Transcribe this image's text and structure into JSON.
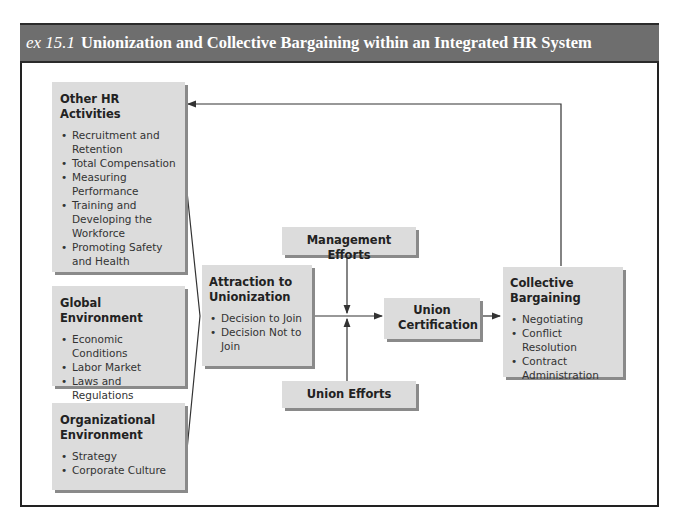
{
  "header": {
    "exhibit_label": "ex 15.1",
    "title": "Unionization and Collective Bargaining within an Integrated HR System"
  },
  "boxes": {
    "other_hr": {
      "title": "Other HR Activities",
      "items": [
        "Recruitment and Retention",
        "Total Compensation",
        "Measuring Performance",
        "Training and Developing the Workforce",
        "Promoting Safety and Health"
      ]
    },
    "global": {
      "title": "Global Environment",
      "items": [
        "Economic Conditions",
        "Labor Market",
        "Laws and Regulations"
      ]
    },
    "organizational": {
      "title": "Organizational Environment",
      "items": [
        "Strategy",
        "Corporate Culture"
      ]
    },
    "attraction": {
      "title": "Attraction to Unionization",
      "items": [
        "Decision to Join",
        "Decision Not to Join"
      ]
    },
    "management_efforts": {
      "title": "Management Efforts"
    },
    "union_efforts": {
      "title": "Union Efforts"
    },
    "union_certification": {
      "title": "Union Certification"
    },
    "collective_bargaining": {
      "title": "Collective Bargaining",
      "items": [
        "Negotiating",
        "Conflict Resolution",
        "Contract Administration"
      ]
    }
  },
  "colors": {
    "header_bg": "#6e6e6e",
    "box_bg": "#dcdcdc",
    "box_shadow": "#8a8a8a",
    "line": "#333333"
  }
}
